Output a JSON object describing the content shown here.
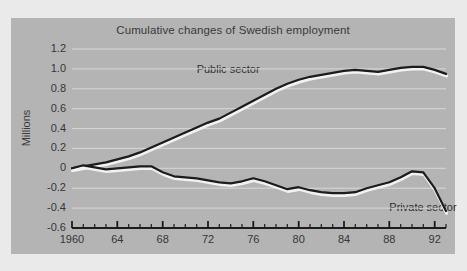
{
  "chart_data": {
    "type": "line",
    "title": "Cumulative changes of Swedish employment",
    "xlabel": "",
    "ylabel": "Millions",
    "xlim": [
      1960,
      1993
    ],
    "ylim": [
      -0.6,
      1.2
    ],
    "yticks": [
      "1.2",
      "1.0",
      "0.8",
      "0.6",
      "0.4",
      "0.2",
      "0",
      "-0.2",
      "-0.4",
      "-0.6"
    ],
    "ytick_values": [
      1.2,
      1.0,
      0.8,
      0.6,
      0.4,
      0.2,
      0,
      -0.2,
      -0.4,
      -0.6
    ],
    "xticks": [
      "1960",
      "64",
      "68",
      "72",
      "76",
      "80",
      "84",
      "88",
      "92"
    ],
    "xtick_values": [
      1960,
      1964,
      1968,
      1972,
      1976,
      1980,
      1984,
      1988,
      1992
    ],
    "minor_xtick_interval": 1,
    "grid": "horizontal-white",
    "legend": "inline-annotations",
    "x": [
      1960,
      1961,
      1962,
      1963,
      1964,
      1965,
      1966,
      1967,
      1968,
      1969,
      1970,
      1971,
      1972,
      1973,
      1974,
      1975,
      1976,
      1977,
      1978,
      1979,
      1980,
      1981,
      1982,
      1983,
      1984,
      1985,
      1986,
      1987,
      1988,
      1989,
      1990,
      1991,
      1992,
      1993
    ],
    "series": [
      {
        "name": "Public sector",
        "color": "#1c1c1c",
        "values": [
          0.0,
          0.02,
          0.04,
          0.06,
          0.09,
          0.12,
          0.16,
          0.21,
          0.26,
          0.31,
          0.36,
          0.41,
          0.46,
          0.5,
          0.56,
          0.62,
          0.68,
          0.74,
          0.8,
          0.85,
          0.89,
          0.92,
          0.94,
          0.96,
          0.98,
          0.99,
          0.98,
          0.97,
          0.99,
          1.01,
          1.02,
          1.02,
          0.99,
          0.95
        ]
      },
      {
        "name": "Private sector",
        "color": "#1c1c1c",
        "values": [
          0.0,
          0.03,
          0.01,
          -0.01,
          0.0,
          0.01,
          0.02,
          0.02,
          -0.04,
          -0.08,
          -0.09,
          -0.1,
          -0.12,
          -0.14,
          -0.15,
          -0.13,
          -0.1,
          -0.13,
          -0.17,
          -0.21,
          -0.19,
          -0.22,
          -0.24,
          -0.25,
          -0.25,
          -0.24,
          -0.2,
          -0.17,
          -0.14,
          -0.09,
          -0.03,
          -0.04,
          -0.2,
          -0.43
        ]
      }
    ],
    "annotations": [
      {
        "text": "Public sector",
        "x": 1971,
        "y": 0.99
      },
      {
        "text": "Private sector",
        "x": 1988,
        "y": -0.4
      }
    ]
  }
}
